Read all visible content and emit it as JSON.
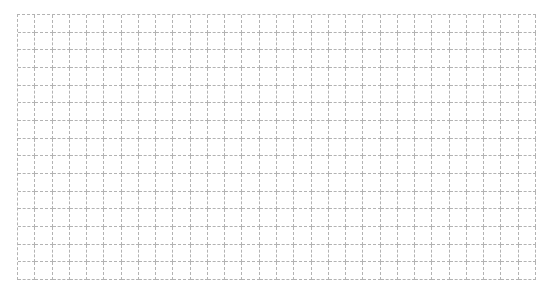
{
  "header": {
    "title": ""
  },
  "grid": {
    "columns": 30,
    "rows": 15,
    "line_color": "#b3b3b3",
    "line_style": "dashed"
  }
}
